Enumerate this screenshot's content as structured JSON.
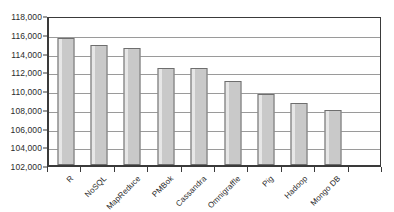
{
  "chart_data": {
    "type": "bar",
    "title": "",
    "subtitle": "",
    "xlabel": "",
    "ylabel": "",
    "categories": [
      "R",
      "NoSQL",
      "MapReduce",
      "PMBok",
      "Cassandra",
      "Omnigraffle",
      "Pig",
      "Hadoop",
      "Mongo DB",
      ""
    ],
    "values": [
      115600,
      114850,
      114500,
      112350,
      112400,
      111000,
      109550,
      108600,
      107850,
      null
    ],
    "ylim": [
      102000,
      118000
    ],
    "ytick_step": 2000,
    "ytick_labels": [
      "118,000",
      "116,000",
      "114,000",
      "112,000",
      "110,000",
      "108,000",
      "106,000",
      "104,000",
      "102,000"
    ],
    "ytick_values": [
      118000,
      116000,
      114000,
      112000,
      110000,
      108000,
      106000,
      104000,
      102000
    ],
    "grid": true,
    "legend": null,
    "legend_position": "none",
    "series": [
      {
        "name": "",
        "values": [
          115600,
          114850,
          114500,
          112350,
          112400,
          111000,
          109550,
          108600,
          107850,
          null
        ]
      }
    ],
    "colors": {
      "bar_fill": "#c9c9c9",
      "bar_border": "#6e6e6e",
      "gridline": "#9a9a9a",
      "axis": "#3a3a3a",
      "text": "#2b2b2b",
      "background": "#ffffff"
    }
  }
}
